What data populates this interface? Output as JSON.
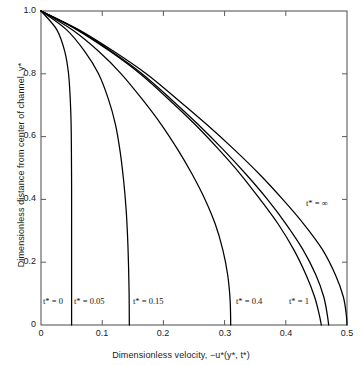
{
  "chart_data": {
    "type": "line",
    "title": "",
    "xlabel": "Dimensionless velocity,  −u*(y*, t*)",
    "ylabel": "Dimensionless distance from center of channel, y*",
    "xlim": [
      0,
      0.5
    ],
    "ylim": [
      0,
      1.0
    ],
    "xticks": [
      0,
      0.1,
      0.2,
      0.3,
      0.4,
      0.5
    ],
    "xtick_labels": [
      "0",
      "0.1",
      "0.2",
      "0.3",
      "0.4",
      "0.5"
    ],
    "yticks": [
      0,
      0.2,
      0.4,
      0.6,
      0.8,
      1.0
    ],
    "ytick_labels": [
      "0",
      "0.2",
      "0.4",
      "0.6",
      "0.8",
      "1.0"
    ],
    "grid": false,
    "legend": "inline-curve-labels",
    "line_color": "#000000",
    "background": "#ffffff",
    "series": [
      {
        "name": "t* = 0",
        "label": "t* = 0",
        "x": [
          0.0,
          0.026,
          0.039,
          0.045,
          0.0478,
          0.0492,
          0.0497,
          0.05,
          0.05,
          0.05,
          0.05,
          0.05
        ],
        "y": [
          1.0,
          0.94,
          0.87,
          0.8,
          0.72,
          0.64,
          0.55,
          0.44,
          0.33,
          0.22,
          0.11,
          0.0
        ]
      },
      {
        "name": "t* = 0.05",
        "label": "t* = 0.05",
        "x": [
          0.0,
          0.042,
          0.072,
          0.094,
          0.11,
          0.1215,
          0.1295,
          0.135,
          0.139,
          0.1415,
          0.143,
          0.144,
          0.1443
        ],
        "y": [
          1.0,
          0.94,
          0.87,
          0.8,
          0.72,
          0.64,
          0.55,
          0.46,
          0.37,
          0.28,
          0.19,
          0.095,
          0.0
        ]
      },
      {
        "name": "t* = 0.15",
        "label": "t* = 0.15",
        "x": [
          0.0,
          0.051,
          0.095,
          0.131,
          0.165,
          0.196,
          0.223,
          0.247,
          0.268,
          0.285,
          0.297,
          0.305,
          0.309,
          0.31
        ],
        "y": [
          1.0,
          0.94,
          0.87,
          0.8,
          0.72,
          0.64,
          0.56,
          0.48,
          0.4,
          0.32,
          0.24,
          0.16,
          0.08,
          0.0
        ]
      },
      {
        "name": "t* = 0.4",
        "label": "t* = 0.4",
        "x": [
          0.0,
          0.059,
          0.114,
          0.162,
          0.208,
          0.251,
          0.29,
          0.326,
          0.358,
          0.388,
          0.413,
          0.433,
          0.447,
          0.455,
          0.458
        ],
        "y": [
          1.0,
          0.94,
          0.87,
          0.8,
          0.72,
          0.64,
          0.56,
          0.48,
          0.4,
          0.32,
          0.24,
          0.16,
          0.09,
          0.03,
          0.0
        ]
      },
      {
        "name": "t* = 1",
        "label": "t* = 1",
        "x": [
          0.0,
          0.06,
          0.116,
          0.165,
          0.212,
          0.256,
          0.297,
          0.335,
          0.37,
          0.401,
          0.428,
          0.449,
          0.462,
          0.468,
          0.47
        ],
        "y": [
          1.0,
          0.94,
          0.87,
          0.8,
          0.72,
          0.64,
          0.56,
          0.48,
          0.4,
          0.32,
          0.24,
          0.16,
          0.09,
          0.03,
          0.0
        ]
      },
      {
        "name": "t* = infinity",
        "label": "t* = ∞",
        "x": [
          0.0,
          0.062,
          0.12,
          0.172,
          0.222,
          0.27,
          0.315,
          0.357,
          0.395,
          0.43,
          0.46,
          0.481,
          0.494,
          0.499,
          0.5
        ],
        "y": [
          1.0,
          0.94,
          0.87,
          0.8,
          0.72,
          0.64,
          0.56,
          0.48,
          0.4,
          0.32,
          0.24,
          0.16,
          0.09,
          0.03,
          0.0
        ]
      }
    ],
    "annotations": [
      {
        "text": "t* = 0",
        "x": 0.004,
        "y": 0.065
      },
      {
        "text": "t* = 0.05",
        "x": 0.054,
        "y": 0.065
      },
      {
        "text": "t* = 0.15",
        "x": 0.15,
        "y": 0.065
      },
      {
        "text": "t* = 0.4",
        "x": 0.318,
        "y": 0.065
      },
      {
        "text": "t* = 1",
        "x": 0.404,
        "y": 0.065
      },
      {
        "text": "t* = ∞",
        "x": 0.455,
        "y": 0.385
      }
    ]
  },
  "labels": {
    "x_title": "Dimensionless velocity,  −u*(y*, t*)",
    "y_title": "Dimensionless distance from center of channel, y*",
    "xt0": "0",
    "xt1": "0.1",
    "xt2": "0.2",
    "xt3": "0.3",
    "xt4": "0.4",
    "xt5": "0.5",
    "yt0": "0",
    "yt1": "0.2",
    "yt2": "0.4",
    "yt3": "0.6",
    "yt4": "0.8",
    "yt5": "1.0",
    "ann0": "t* = 0",
    "ann1": "t* = 0.05",
    "ann2": "t* = 0.15",
    "ann3": "t* = 0.4",
    "ann4": "t* = 1",
    "ann5": "t* = ∞"
  }
}
